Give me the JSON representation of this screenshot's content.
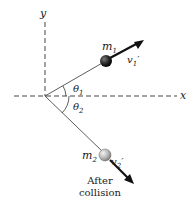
{
  "diagram": {
    "axes": {
      "x_label": "x",
      "y_label": "y"
    },
    "particles": [
      {
        "mass_label": "m",
        "mass_sub": "1",
        "velocity_label": "v",
        "velocity_sub": "1",
        "velocity_prime": "′",
        "color": "#1a1a1a"
      },
      {
        "mass_label": "m",
        "mass_sub": "2",
        "velocity_label": "v",
        "velocity_sub": "2",
        "velocity_prime": "′",
        "color": "#b0b0b0"
      }
    ],
    "angles": [
      {
        "symbol": "θ",
        "sub": "1"
      },
      {
        "symbol": "θ",
        "sub": "2"
      }
    ],
    "caption_line1": "After",
    "caption_line2": "collision"
  }
}
